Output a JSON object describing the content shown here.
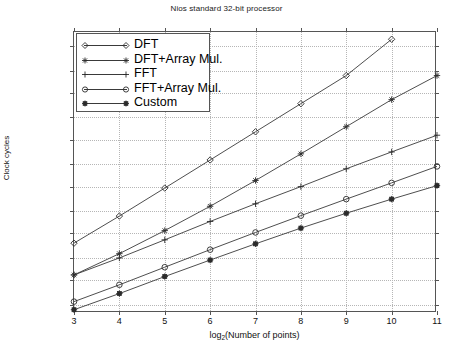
{
  "chart_data": {
    "type": "line",
    "title": "Nios standard 32-bit processor",
    "xlabel": "log_2(Number of points)",
    "xlabel_base": "log",
    "xlabel_sub": "2",
    "xlabel_rest": "(Number of points)",
    "ylabel": "Clock cycles",
    "xscale": "linear",
    "yscale": "log",
    "xlim": [
      3,
      11
    ],
    "ylim": [
      2000,
      2000000000
    ],
    "grid": true,
    "legend_position": "upper-left",
    "x_ticks": [
      3,
      4,
      5,
      6,
      7,
      8,
      9,
      10,
      11
    ],
    "x_tick_labels": [
      "3",
      "4",
      "5",
      "6",
      "7",
      "8",
      "9",
      "10",
      "11"
    ],
    "y_ticks": [
      1000000000,
      300000000,
      100000000,
      30000000,
      10000000,
      3000000,
      1000000,
      300000,
      100000,
      30000,
      10000,
      3000
    ],
    "y_tick_labels": [
      "1000000000",
      "300000000",
      "100000000",
      "30000000",
      "10000000",
      "3000000",
      "1000000",
      "300000",
      "100000",
      "30000",
      "10000",
      "3000"
    ],
    "x": [
      3,
      4,
      5,
      6,
      7,
      8,
      9,
      10,
      11
    ],
    "series": [
      {
        "name": "DFT",
        "marker": "diamond",
        "x": [
          3,
          4,
          5,
          6,
          7,
          8,
          9,
          10
        ],
        "values": [
          62000,
          235000,
          930000,
          3700000,
          14800000,
          59000000,
          235000000,
          1400000000
        ]
      },
      {
        "name": "DFT+Array Mul.",
        "marker": "star",
        "x": [
          3,
          4,
          5,
          6,
          7,
          8,
          9,
          10,
          11
        ],
        "values": [
          13000,
          37000,
          115000,
          380000,
          1350000,
          5000000,
          19000000,
          72000000,
          235000000
        ]
      },
      {
        "name": "FFT",
        "marker": "plus",
        "x": [
          3,
          4,
          5,
          6,
          7,
          8,
          9,
          10,
          11
        ],
        "values": [
          13000,
          30000,
          73000,
          180000,
          430000,
          1000000,
          2400000,
          5500000,
          12500000
        ]
      },
      {
        "name": "FFT+Array Mul.",
        "marker": "circle",
        "x": [
          3,
          4,
          5,
          6,
          7,
          8,
          9,
          10,
          11
        ],
        "values": [
          3500,
          8000,
          19000,
          45000,
          105000,
          240000,
          540000,
          1200000,
          2700000
        ]
      },
      {
        "name": "Custom",
        "marker": "star-filled",
        "x": [
          3,
          4,
          5,
          6,
          7,
          8,
          9,
          10,
          11
        ],
        "values": [
          2350,
          5200,
          12000,
          27000,
          60000,
          130000,
          270000,
          540000,
          1050000
        ]
      }
    ]
  },
  "legend": {
    "items": [
      {
        "label": "DFT",
        "marker": "diamond"
      },
      {
        "label": "DFT+Array Mul.",
        "marker": "star"
      },
      {
        "label": "FFT",
        "marker": "plus"
      },
      {
        "label": "FFT+Array Mul.",
        "marker": "circle"
      },
      {
        "label": "Custom",
        "marker": "star-filled"
      }
    ]
  },
  "colors": {
    "line": "#3a3a3a",
    "marker": "#2b2b2b",
    "axis": "#555555",
    "grid": "#b6b6b6",
    "background": "#ffffff",
    "text": "#111111"
  }
}
